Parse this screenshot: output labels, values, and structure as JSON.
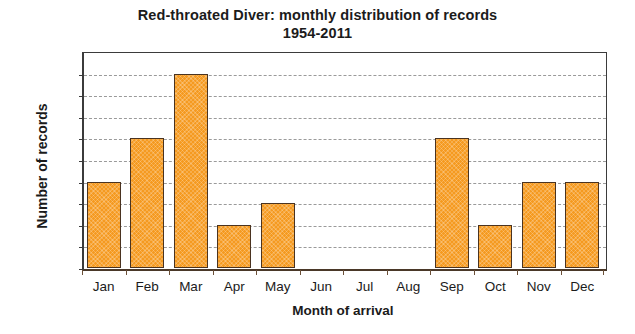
{
  "chart_data": {
    "type": "bar",
    "title": "Red-throated Diver: monthly distribution of records",
    "subtitle": "1954-2011",
    "xlabel": "Month of arrival",
    "ylabel": "Number of records",
    "categories": [
      "Jan",
      "Feb",
      "Mar",
      "Apr",
      "May",
      "Jun",
      "Jul",
      "Aug",
      "Sep",
      "Oct",
      "Nov",
      "Dec"
    ],
    "values": [
      4,
      6,
      9,
      2,
      3,
      0,
      0,
      0,
      6,
      2,
      4,
      4
    ],
    "ylim": [
      0,
      10
    ],
    "yticks": [
      "0",
      "1",
      "2",
      "3",
      "4",
      "5",
      "6",
      "7",
      "8",
      "9",
      "10"
    ],
    "grid": "horizontal-dashed",
    "legend": "none",
    "bar_color": "#f59a20",
    "bar_edge_color": "#4a3320",
    "gridline_color": "#9a9a9a",
    "axis_color": "#3b3b3b",
    "background": "#ffffff"
  }
}
